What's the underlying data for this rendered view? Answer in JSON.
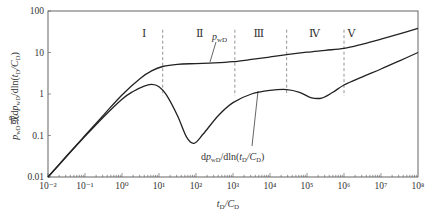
{
  "chart_data": {
    "type": "line",
    "title": "",
    "xlabel": "t_D/C_D",
    "ylabel": "p_wD或dp_wD/dln(t_D/C_D)",
    "xscale": "log",
    "yscale": "log",
    "xlim": [
      0.01,
      100000000
    ],
    "ylim": [
      0.01,
      100
    ],
    "grid": false,
    "legend": "none (inline curve labels)",
    "x_ticks": [
      "10⁻²",
      "10⁻¹",
      "10⁰",
      "10¹",
      "10²",
      "10³",
      "10⁴",
      "10⁵",
      "10⁶",
      "10⁷",
      "10⁸"
    ],
    "y_ticks": [
      "0.01",
      "0.1",
      "1",
      "10",
      "100"
    ],
    "regions": [
      {
        "label": "Ⅰ",
        "x_center_log": 0.6
      },
      {
        "label": "Ⅱ",
        "x_center_log": 2.1
      },
      {
        "label": "Ⅲ",
        "x_center_log": 3.7
      },
      {
        "label": "Ⅳ",
        "x_center_log": 5.2
      },
      {
        "label": "Ⅴ",
        "x_center_log": 6.2
      }
    ],
    "region_boundaries_log_x": [
      1.1,
      3.05,
      4.45,
      6.0
    ],
    "series": [
      {
        "name": "p_wD",
        "label": "p_wD",
        "x_log": [
          -2,
          -1.5,
          -1,
          -0.5,
          0,
          0.5,
          0.8,
          1.1,
          1.5,
          2,
          2.5,
          3,
          3.5,
          4,
          4.5,
          5,
          5.5,
          6,
          6.5,
          7,
          7.5,
          8
        ],
        "y": [
          0.01,
          0.032,
          0.1,
          0.31,
          0.95,
          2.4,
          3.6,
          4.6,
          5.2,
          5.4,
          5.6,
          6.0,
          6.8,
          7.8,
          9.0,
          10.2,
          11.3,
          12.6,
          16,
          21,
          28,
          38
        ]
      },
      {
        "name": "dp_wD/dln(t_D/C_D)",
        "label": "dp_wD/dln(t_D/C_D)",
        "x_log": [
          -2,
          -1.5,
          -1,
          -0.5,
          0,
          0.3,
          0.6,
          0.8,
          1.0,
          1.2,
          1.5,
          1.75,
          1.95,
          2.2,
          2.6,
          3.0,
          3.5,
          4.0,
          4.45,
          4.8,
          5.1,
          5.4,
          5.7,
          6.0,
          6.5,
          7,
          7.5,
          8
        ],
        "y": [
          0.01,
          0.031,
          0.095,
          0.28,
          0.75,
          1.15,
          1.55,
          1.7,
          1.5,
          0.95,
          0.3,
          0.09,
          0.065,
          0.11,
          0.3,
          0.62,
          1.0,
          1.22,
          1.28,
          1.1,
          0.82,
          0.8,
          1.1,
          1.65,
          2.6,
          4.0,
          6.3,
          10
        ]
      }
    ]
  },
  "labels": {
    "x_axis_title_t": "t",
    "x_axis_title_sub1": "D",
    "x_axis_title_c": "/C",
    "x_axis_title_sub2": "D",
    "y_axis_title": "p_wD或dp_wD/dln(t_D/C_D)",
    "curve1_label": "p",
    "curve1_sub": "wD",
    "curve2_label_pre": "dp",
    "curve2_sub": "wD",
    "curve2_label_post": "/dln(t",
    "curve2_sub2": "D",
    "curve2_label_mid": "/C",
    "curve2_sub3": "D",
    "curve2_label_end": ")"
  },
  "colors": {
    "axis": "#555555",
    "curve": "#222222",
    "dashed": "#888888",
    "text": "#333333"
  }
}
